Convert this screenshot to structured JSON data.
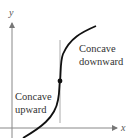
{
  "diagram": {
    "axes": {
      "x_label": "x",
      "y_label": "y"
    },
    "regions": [
      {
        "label_line1": "Concave",
        "label_line2": "downward"
      },
      {
        "label_line1": "Concave",
        "label_line2": "upward"
      }
    ],
    "inflection_point": {
      "marker": "dot"
    },
    "colors": {
      "curve": "#111111",
      "axes": "#777777",
      "divider": "#999999",
      "text": "#333333"
    }
  }
}
